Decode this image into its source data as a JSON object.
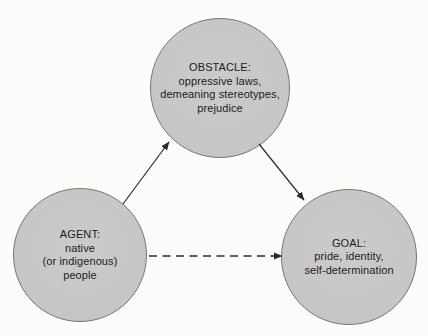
{
  "diagram": {
    "nodes": {
      "obstacle": {
        "title": "OBSTACLE:",
        "lines": [
          "oppressive laws,",
          "demeaning stereotypes,",
          "prejudice"
        ]
      },
      "agent": {
        "title": "AGENT:",
        "lines": [
          "native",
          "(or indigenous)",
          "people"
        ]
      },
      "goal": {
        "title": "GOAL:",
        "lines": [
          "pride, identity,",
          "self-determination"
        ]
      }
    },
    "edges": [
      {
        "from": "AGENT",
        "to": "OBSTACLE",
        "style": "solid"
      },
      {
        "from": "OBSTACLE",
        "to": "GOAL",
        "style": "solid"
      },
      {
        "from": "AGENT",
        "to": "GOAL",
        "style": "dashed"
      }
    ],
    "colors": {
      "node_fill": "#c7c7c7",
      "node_border": "#757575",
      "text": "#1c1c1c",
      "arrow": "#2b2b2b",
      "background": "#fcfcfa"
    }
  }
}
